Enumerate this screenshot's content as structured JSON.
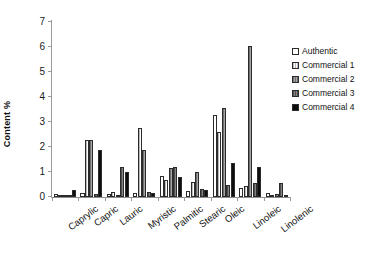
{
  "chart_data": {
    "type": "bar",
    "title": "",
    "xlabel": "",
    "ylabel": "Content %",
    "ylim": [
      0,
      7
    ],
    "yticks": [
      0,
      1,
      2,
      3,
      4,
      5,
      6,
      7
    ],
    "ytick_labels": [
      "0",
      "1",
      "2",
      "3",
      "4",
      "5",
      "6",
      "7"
    ],
    "grid": false,
    "legend_position": "right",
    "categories": [
      "Caprylic",
      "Capric",
      "Lauric",
      "Myristic",
      "Palmitic",
      "Stearic",
      "Oleic",
      "Linoleic",
      "Linolenic"
    ],
    "series": [
      {
        "name": "Authentic",
        "color": "#ffffff",
        "fill": "solid-white",
        "values": [
          0.12,
          0.15,
          0.12,
          0.15,
          0.85,
          0.25,
          3.3,
          0.35,
          0.15
        ]
      },
      {
        "name": "Commercial 1",
        "color": "#ffffff",
        "fill": "light-hatch",
        "values": [
          0.05,
          2.28,
          0.22,
          2.78,
          0.7,
          0.6,
          2.6,
          0.45,
          0.1
        ]
      },
      {
        "name": "Commercial 2",
        "color": "#8e8e8e",
        "fill": "medium-hatch",
        "values": [
          0.03,
          2.3,
          0.1,
          1.88,
          1.18,
          1.0,
          3.55,
          6.05,
          0.12
        ]
      },
      {
        "name": "Commercial 3",
        "color": "#6a6a6a",
        "fill": "dark-hatch",
        "values": [
          0.08,
          0.12,
          1.2,
          0.22,
          1.22,
          0.32,
          0.5,
          0.55,
          0.55
        ]
      },
      {
        "name": "Commercial 4",
        "color": "#0d0d0d",
        "fill": "solid-black",
        "values": [
          0.3,
          1.88,
          1.0,
          0.18,
          0.82,
          0.28,
          1.35,
          1.22,
          0.05
        ]
      }
    ]
  }
}
